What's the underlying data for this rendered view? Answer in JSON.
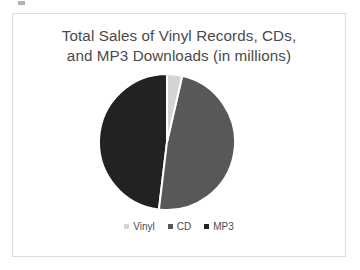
{
  "chart_data": {
    "type": "pie",
    "title": "Total Sales of Vinyl Records, CDs, and MP3 Downloads (in millions)",
    "title_lines": [
      "Total Sales of Vinyl Records, CDs,",
      "and MP3 Downloads (in millions)"
    ],
    "categories": [
      "Vinyl",
      "CD",
      "MP3"
    ],
    "values": [
      3.6,
      48.3,
      48.1
    ],
    "value_unit": "millions",
    "slice_percents": [
      3.6,
      48.3,
      48.1
    ],
    "slice_angles_deg": [
      13,
      174,
      173
    ],
    "colors": [
      "#d4d4d4",
      "#58585a",
      "#222222"
    ],
    "start_angle_deg": 0,
    "direction": "clockwise",
    "legend": {
      "position": "bottom",
      "entries": [
        {
          "label": "Vinyl",
          "color": "#d4d4d4"
        },
        {
          "label": "CD",
          "color": "#58585a"
        },
        {
          "label": "MP3",
          "color": "#222222"
        }
      ]
    },
    "xlabel": "",
    "ylabel": "",
    "grid": false,
    "data_labels_shown": false,
    "slice_border_color": "#ffffff"
  },
  "frame": {
    "border_color": "#dcdcdc",
    "background": "#ffffff"
  }
}
